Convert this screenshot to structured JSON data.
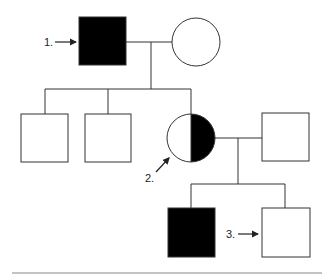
{
  "diagram": {
    "type": "pedigree",
    "colors": {
      "affected": "#000000",
      "unaffected": "#ffffff",
      "line": "#333333",
      "rule": "#888888"
    },
    "generation1": {
      "father": {
        "sex": "male",
        "status": "affected",
        "label": "1."
      },
      "mother": {
        "sex": "female",
        "status": "unaffected"
      }
    },
    "generation2": {
      "children": [
        {
          "sex": "male",
          "status": "unaffected"
        },
        {
          "sex": "male",
          "status": "unaffected"
        },
        {
          "sex": "female",
          "status": "carrier",
          "label": "2."
        }
      ],
      "spouse": {
        "sex": "male",
        "status": "unaffected"
      }
    },
    "generation3": {
      "children": [
        {
          "sex": "male",
          "status": "affected"
        },
        {
          "sex": "male",
          "status": "unaffected",
          "label": "3."
        }
      ]
    }
  }
}
